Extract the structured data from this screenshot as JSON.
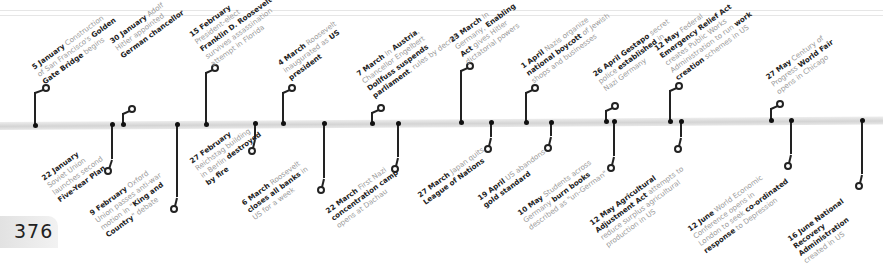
{
  "page_number": "376",
  "colors": {
    "bold_text": "#222222",
    "regular_text": "#9a9a9a",
    "bar": "#d8d8d8",
    "marker": "#222222"
  },
  "events": [
    {
      "date": "5 January",
      "lines": [
        [
          "5 January",
          " Construction"
        ],
        [
          "of San Francisco's ",
          "Golden"
        ],
        [
          "Gate Bridge",
          " begins"
        ]
      ],
      "side": "above"
    },
    {
      "date": "22 January",
      "lines": [
        [
          "22 January"
        ],
        [
          "Soviet Union"
        ],
        [
          "launches second"
        ],
        [
          "Five-Year Plan"
        ]
      ],
      "side": "below"
    },
    {
      "date": "30 January",
      "lines": [
        [
          "30 January",
          " Adolf"
        ],
        [
          "Hitler appointed"
        ],
        [
          "German chancellor"
        ]
      ],
      "side": "above"
    },
    {
      "date": "9 February",
      "lines": [
        [
          "9 February",
          " Oxford"
        ],
        [
          "Union passes anti-war"
        ],
        [
          "motion in \"",
          "King and"
        ],
        [
          "Country",
          "\" debate"
        ]
      ],
      "side": "below"
    },
    {
      "date": "15 February",
      "lines": [
        [
          "15 February"
        ],
        [
          "President-elect"
        ],
        [
          "Franklin D. Roosevelt"
        ],
        [
          "survives assassination"
        ],
        [
          "attempt in Florida"
        ]
      ],
      "side": "above"
    },
    {
      "date": "27 February",
      "lines": [
        [
          "27 February"
        ],
        [
          "Reichstag building"
        ],
        [
          "in Berlin ",
          "destroyed"
        ],
        [
          "by fire"
        ]
      ],
      "side": "below"
    },
    {
      "date": "4 March",
      "lines": [
        [
          "4 March",
          " Roosevelt"
        ],
        [
          "inaugurated as ",
          "US"
        ],
        [
          "president"
        ]
      ],
      "side": "above"
    },
    {
      "date": "6 March",
      "lines": [
        [
          "6 March",
          " Roosevelt"
        ],
        [
          "closes all banks",
          " in"
        ],
        [
          "US for a week"
        ]
      ],
      "side": "below"
    },
    {
      "date": "7 March",
      "lines": [
        [
          "7 March",
          " In ",
          "Austria",
          ","
        ],
        [
          "Chancellor Engelbert"
        ],
        [
          "Dollfuss suspends"
        ],
        [
          "parliament",
          ", rules by decree"
        ]
      ],
      "side": "above"
    },
    {
      "date": "22 March",
      "lines": [
        [
          "22 March",
          " First Nazi"
        ],
        [
          "concentration camp"
        ],
        [
          "opens at Dachau"
        ]
      ],
      "side": "below"
    },
    {
      "date": "23 March",
      "lines": [
        [
          "23 March",
          " In"
        ],
        [
          "Germany, ",
          "Enabling"
        ],
        [
          "Act",
          " gives Hitler"
        ],
        [
          "dictatorial powers"
        ]
      ],
      "side": "above"
    },
    {
      "date": "27 March",
      "lines": [
        [
          "27 March",
          " Japan quits"
        ],
        [
          "League of Nations"
        ]
      ],
      "side": "below"
    },
    {
      "date": "1 April",
      "lines": [
        [
          "1 April",
          " Nazis organize"
        ],
        [
          "national boycott",
          " of Jewish"
        ],
        [
          "shops and businesses"
        ]
      ],
      "side": "above"
    },
    {
      "date": "19 April",
      "lines": [
        [
          "19 April",
          " US abandons"
        ],
        [
          "gold standard"
        ]
      ],
      "side": "below"
    },
    {
      "date": "26 April",
      "lines": [
        [
          "26 April Gestapo",
          " secret"
        ],
        [
          "police ",
          "established",
          " in"
        ],
        [
          "Nazi Germany"
        ]
      ],
      "side": "above"
    },
    {
      "date": "10 May",
      "lines": [
        [
          "10 May",
          " Students across"
        ],
        [
          "Germany ",
          "burn books"
        ],
        [
          "described as \"un-German\""
        ]
      ],
      "side": "below"
    },
    {
      "date": "12 May",
      "lines": [
        [
          "12 May",
          " Federal"
        ],
        [
          "Emergency Relief Act"
        ],
        [
          "creates Public Works"
        ],
        [
          "Administration to run ",
          "work"
        ],
        [
          "creation",
          " schemes in US"
        ]
      ],
      "side": "above"
    },
    {
      "date": "12 May",
      "lines": [
        [
          "12 May Agricultural"
        ],
        [
          "Adjustment Act",
          " attempts to"
        ],
        [
          "reduce surplus agricultural"
        ],
        [
          "production in US"
        ]
      ],
      "side": "below"
    },
    {
      "date": "27 May",
      "lines": [
        [
          "27 May",
          " Century of"
        ],
        [
          "Progress ",
          "World Fair"
        ],
        [
          "opens in Chicago"
        ]
      ],
      "side": "above"
    },
    {
      "date": "12 June",
      "lines": [
        [
          "12 June",
          " World Economic"
        ],
        [
          "Conference opens in"
        ],
        [
          "London to seek ",
          "co-ordinated"
        ],
        [
          "response",
          " to Depression"
        ]
      ],
      "side": "below"
    },
    {
      "date": "16 June",
      "lines": [
        [
          "16 June National"
        ],
        [
          "Recovery"
        ],
        [
          "Administration"
        ],
        [
          "created in US"
        ]
      ],
      "side": "below"
    }
  ]
}
